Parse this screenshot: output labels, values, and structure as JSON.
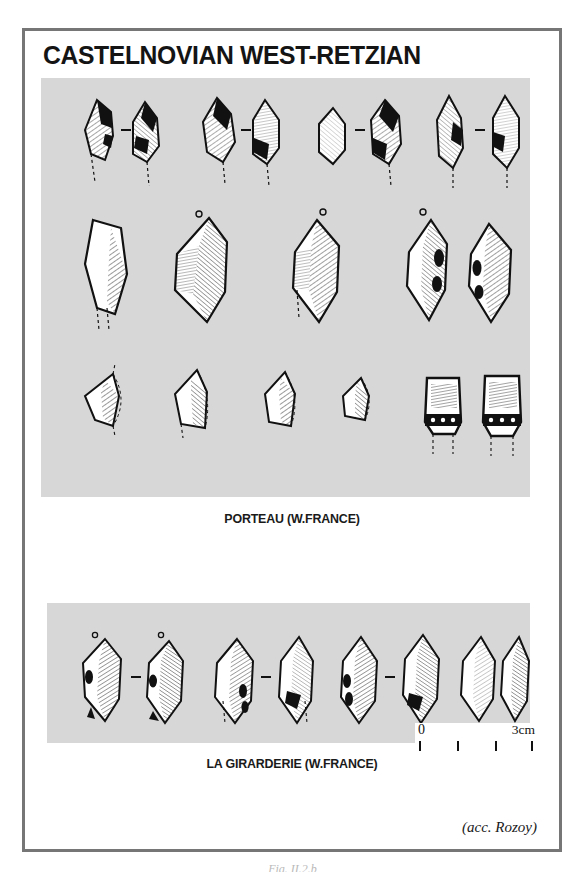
{
  "figure": {
    "title": "CASTELNOVIAN WEST-RETZIAN",
    "attribution": "(acc. Rozoy)",
    "figure_number": "Fig. II.2.b",
    "frame_color": "#767676",
    "plate_background": "#d7d7d7",
    "page_background": "#ffffff"
  },
  "plates": [
    {
      "id": "porteau",
      "caption": "PORTEAU (W.FRANCE)",
      "rows": [
        {
          "row_label": "row-1-microliths",
          "artifact_count": 8,
          "groups": [
            {
              "pair": true,
              "separator": "–"
            },
            {
              "pair": true,
              "separator": "–"
            },
            {
              "pair": true,
              "separator": "–"
            },
            {
              "pair": true,
              "separator": "–"
            }
          ]
        },
        {
          "row_label": "row-2-points",
          "artifact_count": 6,
          "groups": [
            {
              "pair": false,
              "separator": ""
            },
            {
              "pair": false,
              "separator": ""
            },
            {
              "pair": false,
              "separator": ""
            },
            {
              "pair": true,
              "separator": ""
            }
          ]
        },
        {
          "row_label": "row-3-trapezes",
          "artifact_count": 6,
          "groups": [
            {
              "pair": false,
              "separator": ""
            },
            {
              "pair": false,
              "separator": ""
            },
            {
              "pair": false,
              "separator": ""
            },
            {
              "pair": false,
              "separator": ""
            },
            {
              "pair": true,
              "separator": ""
            }
          ]
        }
      ]
    },
    {
      "id": "girarderie",
      "caption": "LA GIRARDERIE (W.FRANCE)",
      "rows": [
        {
          "row_label": "row-1-points",
          "artifact_count": 8,
          "groups": [
            {
              "pair": true,
              "separator": "–"
            },
            {
              "pair": true,
              "separator": "–"
            },
            {
              "pair": true,
              "separator": "–"
            },
            {
              "pair": true,
              "separator": ""
            }
          ]
        }
      ]
    }
  ],
  "scale_bar": {
    "min_label": "0",
    "max_label": "3cm",
    "tick_count": 4,
    "tick_values": [
      "0",
      "1",
      "2",
      "3"
    ],
    "units": "cm"
  }
}
